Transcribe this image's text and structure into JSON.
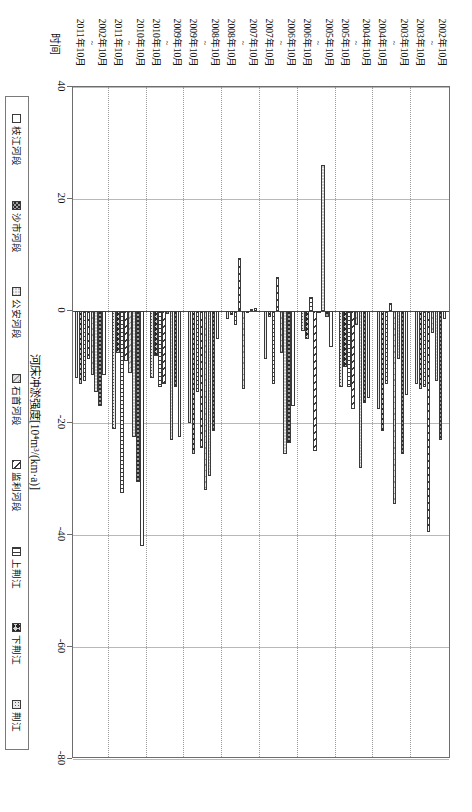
{
  "figure": {
    "orientation": "rotated-90ccw",
    "value_axis_title": "河床冲淤强度[10⁴m³/(km·a)]",
    "category_axis_title": "时间"
  },
  "chart_data": {
    "type": "bar",
    "title": "",
    "xlabel": "时间",
    "ylabel": "河床冲淤强度[10⁴m³/(km·a)]",
    "ylim": [
      -80,
      40
    ],
    "yticks": [
      40,
      20,
      0,
      -20,
      -40,
      -60,
      -80
    ],
    "grid": true,
    "legend_position": "bottom",
    "orientation": "vertical-columns-rotated",
    "categories": [
      "2002年10月~2003年10月",
      "2003年10月~2004年10月",
      "2004年10月~2005年10月",
      "2005年10月~2006年10月",
      "2006年10月~2007年10月",
      "2007年10月~2008年10月",
      "2008年10月~2009年10月",
      "2009年10月~2010年10月",
      "2010年10月~2011年10月",
      "2002年10月~2011年10月"
    ],
    "category_lines": [
      [
        "2002年10月",
        "~",
        "2003年10月"
      ],
      [
        "2003年10月",
        "~",
        "2004年10月"
      ],
      [
        "2004年10月",
        "~",
        "2005年10月"
      ],
      [
        "2005年10月",
        "~",
        "2006年10月"
      ],
      [
        "2006年10月",
        "~",
        "2007年10月"
      ],
      [
        "2007年10月",
        "~",
        "2008年10月"
      ],
      [
        "2008年10月",
        "~",
        "2009年10月"
      ],
      [
        "2009年10月",
        "~",
        "2010年10月"
      ],
      [
        "2010年10月",
        "~",
        "2011年10月"
      ],
      [
        "2002年10月",
        "~",
        "2011年10月"
      ]
    ],
    "series": [
      {
        "name": "枝江河段",
        "pattern": "p-zhijiang",
        "values": [
          -1.5,
          -15.0,
          -15.5,
          -6.5,
          -17.0,
          0.5,
          -5.0,
          -22.5,
          -42.0,
          -11.5
        ]
      },
      {
        "name": "沙市河段",
        "pattern": "p-shashi",
        "values": [
          -23.0,
          -25.5,
          -16.5,
          -1.0,
          -23.5,
          0.3,
          -21.5,
          -13.5,
          -30.5,
          -17.0
        ]
      },
      {
        "name": "公安河段",
        "pattern": "p-gongan",
        "values": [
          -12.5,
          -8.5,
          -28.0,
          26.0,
          -25.5,
          -0.2,
          -29.5,
          -23.0,
          -22.5,
          -14.5
        ]
      },
      {
        "name": "石首河段",
        "pattern": "p-shishou",
        "values": [
          -4.0,
          -34.5,
          -2.5,
          0.0,
          -7.5,
          -14.0,
          -32.0,
          -0.5,
          -11.0,
          -11.5
        ]
      },
      {
        "name": "监利河段",
        "pattern": "p-jianli",
        "values": [
          -39.5,
          1.5,
          -17.5,
          -25.0,
          6.0,
          9.5,
          -24.5,
          -13.0,
          -9.0,
          -8.5
        ]
      },
      {
        "name": "上荆江",
        "pattern": "p-upper",
        "values": [
          -13.5,
          -13.0,
          -13.5,
          2.5,
          -13.0,
          -2.5,
          -14.5,
          -13.5,
          -32.5,
          -12.5
        ]
      },
      {
        "name": "下荆江",
        "pattern": "p-lower",
        "values": [
          -14.0,
          -21.5,
          -10.0,
          -5.0,
          -1.0,
          -0.8,
          -25.5,
          -8.0,
          -7.5,
          -13.0
        ]
      },
      {
        "name": "荆江",
        "pattern": "p-jingjiang",
        "values": [
          -13.0,
          -17.5,
          -13.5,
          -3.5,
          -8.5,
          -1.5,
          -20.0,
          -12.0,
          -21.0,
          -12.0
        ]
      }
    ]
  },
  "legend": {
    "items": [
      {
        "label": "枝江河段",
        "pattern": "p-zhijiang"
      },
      {
        "label": "沙市河段",
        "pattern": "p-shashi"
      },
      {
        "label": "公安河段",
        "pattern": "p-gongan"
      },
      {
        "label": "石首河段",
        "pattern": "p-shishou"
      },
      {
        "label": "监利河段",
        "pattern": "p-jianli"
      },
      {
        "label": "上荆江",
        "pattern": "p-upper"
      },
      {
        "label": "下荆江",
        "pattern": "p-lower"
      },
      {
        "label": "荆江",
        "pattern": "p-jingjiang"
      }
    ]
  }
}
